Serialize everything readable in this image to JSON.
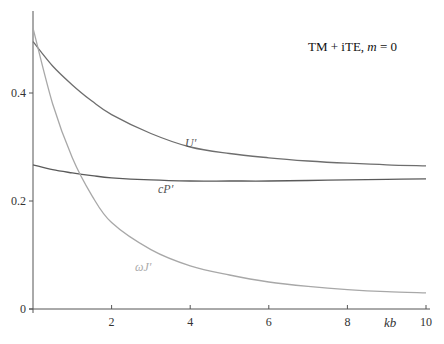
{
  "header": {
    "truncated_text": ""
  },
  "chart_data": {
    "type": "line",
    "title": "",
    "annotation": "TM + iTE, m = 0",
    "annotation_parts": {
      "prefix": "TM + iTE, ",
      "var": "m",
      "suffix": " = 0"
    },
    "xlabel": "kb",
    "ylabel": "",
    "xlim": [
      0,
      10
    ],
    "ylim": [
      0,
      0.53
    ],
    "x_ticks": [
      2,
      4,
      6,
      8,
      10
    ],
    "x_tick_labels": [
      "2",
      "4",
      "6",
      "8",
      "10"
    ],
    "y_ticks": [
      0,
      0.2,
      0.4
    ],
    "y_tick_labels": [
      "0",
      "0.2",
      "0.4"
    ],
    "grid": false,
    "legend": "inline labels",
    "x": [
      0,
      0.5,
      1,
      1.5,
      2,
      3,
      4,
      5,
      6,
      7,
      8,
      9,
      10
    ],
    "series": [
      {
        "name": "U'",
        "label": "U′",
        "color": "#6e6e6e",
        "values": [
          0.495,
          0.45,
          0.415,
          0.385,
          0.36,
          0.325,
          0.3,
          0.288,
          0.28,
          0.274,
          0.27,
          0.267,
          0.265
        ]
      },
      {
        "name": "cP'",
        "label": "cP′",
        "color": "#5a5a5a",
        "values": [
          0.267,
          0.258,
          0.252,
          0.247,
          0.243,
          0.239,
          0.237,
          0.237,
          0.237,
          0.238,
          0.239,
          0.24,
          0.241
        ]
      },
      {
        "name": "ωJ'",
        "label": "ωJ′",
        "color": "#a8a8a8",
        "values": [
          0.52,
          0.38,
          0.28,
          0.21,
          0.16,
          0.11,
          0.08,
          0.063,
          0.05,
          0.042,
          0.036,
          0.032,
          0.03
        ]
      }
    ]
  }
}
